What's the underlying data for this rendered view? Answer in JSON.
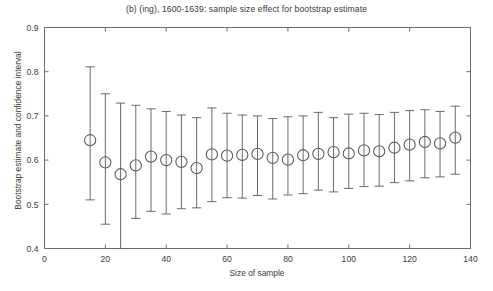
{
  "chart_data": {
    "type": "scatter",
    "title": "(b) (ing), 1600-1639: sample size effect for bootstrap estimate",
    "xlabel": "Size of sample",
    "ylabel": "Bootstrap estimate and confidence interval",
    "xlim": [
      0,
      140
    ],
    "ylim": [
      0.4,
      0.9
    ],
    "xticks": [
      0,
      20,
      40,
      60,
      80,
      100,
      120,
      140
    ],
    "xtick_labels": [
      "0",
      "20",
      "40",
      "60",
      "80",
      "100",
      "120",
      "140"
    ],
    "yticks": [
      0.4,
      0.5,
      0.6,
      0.7,
      0.8,
      0.9
    ],
    "ytick_labels": [
      "0.4",
      "0.5",
      "0.6",
      "0.7",
      "0.8",
      "0.9"
    ],
    "grid": false,
    "legend": "none",
    "marker": "open-circle",
    "error_bar_style": "capped-vertical",
    "x": [
      15,
      20,
      25,
      30,
      35,
      40,
      45,
      50,
      55,
      60,
      65,
      70,
      75,
      80,
      85,
      90,
      95,
      100,
      105,
      110,
      115,
      120,
      125,
      130,
      135
    ],
    "values": [
      0.645,
      0.595,
      0.568,
      0.588,
      0.608,
      0.6,
      0.596,
      0.582,
      0.613,
      0.61,
      0.612,
      0.614,
      0.605,
      0.601,
      0.611,
      0.614,
      0.618,
      0.615,
      0.622,
      0.62,
      0.628,
      0.635,
      0.641,
      0.638,
      0.651
    ],
    "ci_lower": [
      0.51,
      0.455,
      0.4,
      0.468,
      0.484,
      0.478,
      0.49,
      0.492,
      0.506,
      0.515,
      0.514,
      0.52,
      0.512,
      0.521,
      0.524,
      0.532,
      0.528,
      0.536,
      0.54,
      0.541,
      0.549,
      0.553,
      0.56,
      0.562,
      0.568
    ],
    "ci_upper": [
      0.811,
      0.75,
      0.729,
      0.724,
      0.716,
      0.71,
      0.702,
      0.696,
      0.718,
      0.706,
      0.702,
      0.7,
      0.694,
      0.698,
      0.7,
      0.708,
      0.696,
      0.704,
      0.706,
      0.703,
      0.708,
      0.712,
      0.714,
      0.71,
      0.722
    ]
  }
}
